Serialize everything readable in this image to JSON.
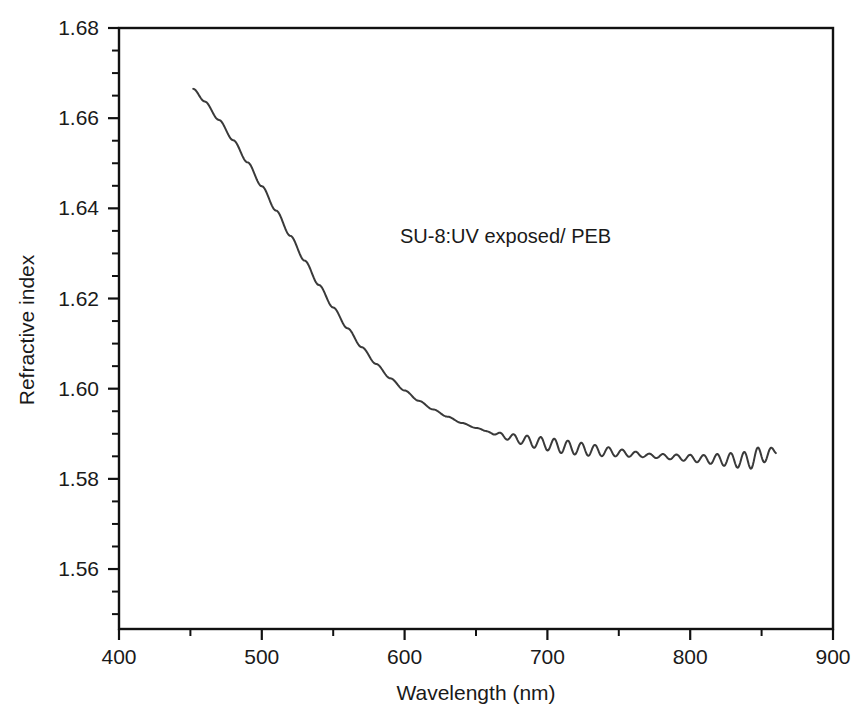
{
  "chart_data": {
    "type": "line",
    "title": "",
    "annotation": "SU-8:UV exposed/ PEB",
    "xlabel": "Wavelength (nm)",
    "ylabel": "Refractive index",
    "xlim": [
      400,
      900
    ],
    "ylim": [
      1.5467,
      1.68
    ],
    "grid": false,
    "legend": "none",
    "xticks": [
      400,
      500,
      600,
      700,
      800,
      900
    ],
    "xtick_labels": [
      "400",
      "500",
      "600",
      "700",
      "800",
      "900"
    ],
    "x_minor_step": 50,
    "yticks": [
      1.56,
      1.58,
      1.6,
      1.62,
      1.64,
      1.66,
      1.68
    ],
    "ytick_labels": [
      "1.56",
      "1.58",
      "1.60",
      "1.62",
      "1.64",
      "1.66",
      "1.68"
    ],
    "y_minor_step": 0.005,
    "series": [
      {
        "name": "SU-8 UV exposed / PEB",
        "color": "#3a3a3a",
        "line_width": 2.0,
        "x_range": [
          452,
          860
        ],
        "comment": "Baseline dispersion (smooth Cauchy-like fall) sampled at 8 nm steps; interference fringes added via fringe model below.",
        "x": [
          452,
          460,
          470,
          480,
          490,
          500,
          510,
          520,
          530,
          540,
          550,
          560,
          570,
          580,
          590,
          600,
          610,
          620,
          630,
          640,
          650,
          660,
          670,
          680,
          690,
          700,
          710,
          720,
          730,
          740,
          750,
          760,
          770,
          780,
          790,
          800,
          810,
          820,
          830,
          840,
          850,
          860
        ],
        "y": [
          1.6665,
          1.6637,
          1.6596,
          1.6551,
          1.6502,
          1.6449,
          1.6395,
          1.6339,
          1.6284,
          1.623,
          1.618,
          1.6134,
          1.6092,
          1.6055,
          1.6023,
          1.5996,
          1.5973,
          1.5954,
          1.5938,
          1.5924,
          1.5913,
          1.5903,
          1.5895,
          1.5888,
          1.5882,
          1.5877,
          1.5872,
          1.5868,
          1.5864,
          1.5861,
          1.5858,
          1.5855,
          1.5852,
          1.585,
          1.5848,
          1.5846,
          1.5844,
          1.5843,
          1.5842,
          1.5841,
          1.5852,
          1.586
        ]
      }
    ],
    "fringes": {
      "description": "Thin-film interference ripple superimposed on the smooth baseline at long wavelengths.",
      "onset_nm": 655,
      "period_nm": 9.5,
      "amplitude_profile": [
        {
          "nm": 655,
          "amp": 0.0
        },
        {
          "nm": 670,
          "amp": 0.0007
        },
        {
          "nm": 690,
          "amp": 0.0013
        },
        {
          "nm": 710,
          "amp": 0.0015
        },
        {
          "nm": 730,
          "amp": 0.0013
        },
        {
          "nm": 750,
          "amp": 0.0008
        },
        {
          "nm": 770,
          "amp": 0.0004
        },
        {
          "nm": 790,
          "amp": 0.0006
        },
        {
          "nm": 810,
          "amp": 0.0009
        },
        {
          "nm": 830,
          "amp": 0.0016
        },
        {
          "nm": 845,
          "amp": 0.0021
        },
        {
          "nm": 855,
          "amp": 0.0014
        },
        {
          "nm": 860,
          "amp": 0.0006
        }
      ]
    }
  },
  "axes": {
    "x_axis_name": "wavelength-axis",
    "y_axis_name": "refractive-index-axis"
  }
}
